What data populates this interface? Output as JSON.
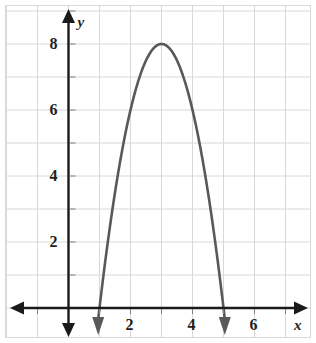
{
  "figure": {
    "kind": "coordinate-grid-graph",
    "background_color": "#ffffff",
    "border_color": "#d9d9d9",
    "grid_color": "#d8d8d8",
    "axis_color": "#1a1a1a",
    "curve_color": "#595959"
  },
  "axis_labels": {
    "x": "x",
    "y": "y"
  },
  "x_ticks": [
    {
      "value": 2,
      "label": "2"
    },
    {
      "value": 4,
      "label": "4"
    },
    {
      "value": 6,
      "label": "6"
    }
  ],
  "y_ticks": [
    {
      "value": 2,
      "label": "2"
    },
    {
      "value": 4,
      "label": "4"
    },
    {
      "value": 6,
      "label": "6"
    },
    {
      "value": 8,
      "label": "8"
    }
  ],
  "chart_data": {
    "type": "line",
    "title": "",
    "xlabel": "x",
    "ylabel": "y",
    "xlim": [
      -2,
      7.7
    ],
    "ylim": [
      -1.1,
      9.2
    ],
    "grid": true,
    "grid_step": 1,
    "legend": "none",
    "curve": {
      "name": "parabola",
      "shape": "downward-opening parabola",
      "equation": "y = -2(x - 1)(x - 5)",
      "expanded": "y = -2x^2 + 12x - 10",
      "vertex": {
        "x": 3,
        "y": 8
      },
      "roots": [
        1,
        5
      ],
      "y_intercept": -10,
      "leading_coefficient": -2,
      "opens": "down",
      "axis_of_symmetry": 3,
      "arrowheads": [
        "left-branch-down",
        "right-branch-down"
      ],
      "points": [
        {
          "x": 1.0,
          "y": 0
        },
        {
          "x": 1.25,
          "y": 1.875
        },
        {
          "x": 1.5,
          "y": 3.5
        },
        {
          "x": 1.75,
          "y": 4.875
        },
        {
          "x": 2.0,
          "y": 6
        },
        {
          "x": 2.25,
          "y": 6.875
        },
        {
          "x": 2.5,
          "y": 7.5
        },
        {
          "x": 2.75,
          "y": 7.875
        },
        {
          "x": 3.0,
          "y": 8
        },
        {
          "x": 3.25,
          "y": 7.875
        },
        {
          "x": 3.5,
          "y": 7.5
        },
        {
          "x": 3.75,
          "y": 6.875
        },
        {
          "x": 4.0,
          "y": 6
        },
        {
          "x": 4.25,
          "y": 4.875
        },
        {
          "x": 4.5,
          "y": 3.5
        },
        {
          "x": 4.75,
          "y": 1.875
        },
        {
          "x": 5.0,
          "y": 0
        }
      ]
    },
    "axes": {
      "x_axis": {
        "arrowheads": [
          "left",
          "right"
        ],
        "tick_values": [
          2,
          4,
          6
        ]
      },
      "y_axis": {
        "arrowheads": [
          "up",
          "down"
        ],
        "tick_values": [
          2,
          4,
          6,
          8
        ]
      }
    }
  }
}
